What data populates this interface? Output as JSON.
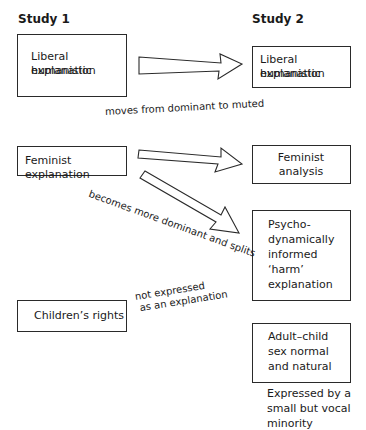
{
  "headings": {
    "study1": "Study 1",
    "study2": "Study 2"
  },
  "study1_boxes": [
    {
      "line1": "Liberal humanistic",
      "line2": "explanation"
    },
    {
      "line1": "Feminist explanation"
    },
    {
      "line1": "Children’s rights"
    }
  ],
  "study2_boxes": [
    {
      "line1": "Liberal humanistic",
      "line2": "explanation"
    },
    {
      "line1": "Feminist",
      "line2": "analysis"
    },
    {
      "line1": "Psycho-",
      "line2": "dynamically",
      "line3": "informed",
      "line4": "‘harm’",
      "line5": "explanation"
    },
    {
      "line1": "Adult–child",
      "line2": "sex normal",
      "line3": "and natural"
    }
  ],
  "annotations": {
    "liberal_transition": "moves from dominant to muted",
    "feminist_transition": "becomes more dominant and splits",
    "children_line1": "not expressed",
    "children_line2": "as an explanation",
    "minority_line1": "Expressed by a",
    "minority_line2": "small but vocal",
    "minority_line3": "minority"
  },
  "arrows": [
    {
      "from": "Liberal humanistic explanation",
      "to": "Liberal humanistic explanation",
      "style": "hollow-block"
    },
    {
      "from": "Feminist explanation",
      "to": "Feminist analysis",
      "style": "hollow-block"
    },
    {
      "from": "Feminist explanation",
      "to": "Psycho-dynamically informed harm explanation",
      "style": "hollow-block"
    }
  ]
}
